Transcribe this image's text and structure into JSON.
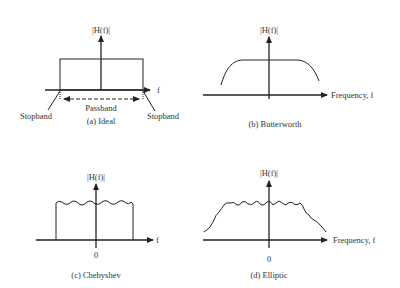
{
  "figure": {
    "panels": [
      {
        "id": "a",
        "caption": "(a) Ideal",
        "y_label": "|H(f)|",
        "x_label": "f",
        "annotations": {
          "passband": "Passband",
          "stopband_left": "Stopband",
          "stopband_right": "Stopband"
        },
        "shape": "rectangular ideal lowpass response"
      },
      {
        "id": "b",
        "caption": "(b) Butterworth",
        "y_label": "|H(f)|",
        "x_label": "Frequency, f",
        "shape": "maximally flat passband with smooth rolloff"
      },
      {
        "id": "c",
        "caption": "(c) Chebyshev",
        "y_label": "|H(f)|",
        "x_label": "f",
        "origin_label": "0",
        "shape": "passband ripple with sharp cutoff"
      },
      {
        "id": "d",
        "caption": "(d) Elliptic",
        "y_label": "|H(f)|",
        "x_label": "Frequency, f",
        "origin_label": "0",
        "shape": "ripple in passband and stopband transition"
      }
    ],
    "colors": {
      "stroke": "#222222",
      "text": "#333333",
      "background": "#ffffff"
    }
  }
}
